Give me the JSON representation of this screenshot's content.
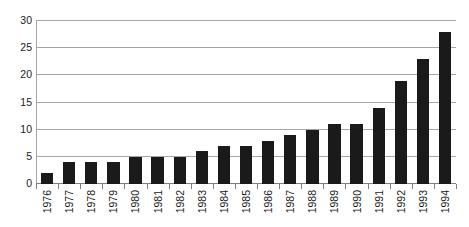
{
  "chart_data": {
    "type": "bar",
    "title": "",
    "subtitle": "",
    "xlabel": "",
    "ylabel": "",
    "categories": [
      "1976",
      "1977",
      "1978",
      "1979",
      "1980",
      "1981",
      "1982",
      "1983",
      "1984",
      "1985",
      "1986",
      "1987",
      "1988",
      "1989",
      "1990",
      "1991",
      "1992",
      "1993",
      "1994"
    ],
    "values": [
      2,
      4,
      4,
      4,
      5,
      5,
      5,
      6,
      7,
      7,
      8,
      9,
      10,
      11,
      11,
      14,
      19,
      23,
      28
    ],
    "series": [
      {
        "name": "",
        "values": [
          2,
          4,
          4,
          4,
          5,
          5,
          5,
          6,
          7,
          7,
          8,
          9,
          10,
          11,
          11,
          14,
          19,
          23,
          28
        ]
      }
    ],
    "ylim": [
      0,
      30
    ],
    "ytick_values": [
      0,
      5,
      10,
      15,
      20,
      25,
      30
    ],
    "ytick_labels": [
      "0",
      "5",
      "10",
      "15",
      "20",
      "25",
      "30"
    ],
    "ytick_interval": 5,
    "grid": true,
    "grid_axis": "y",
    "legend": false,
    "legend_position": "none",
    "annotations": [],
    "xtick_label_rotation": 90,
    "colors": {
      "bar": "#1a1a1a",
      "gridline": "#a6a6a6",
      "axis": "#808080",
      "text": "#1a1a1a",
      "background": "#ffffff"
    }
  }
}
